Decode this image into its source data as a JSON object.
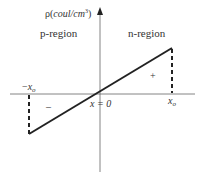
{
  "diagram": {
    "y_axis_label": "ρ(coul/cm³)",
    "y_axis_label_parts": {
      "rho": "ρ(",
      "unit": "coul/cm",
      "exp": "3",
      "close": ")"
    },
    "left_region": "p-region",
    "right_region": "n-region",
    "origin_label": "x = 0",
    "neg_edge_label": {
      "sign": "−",
      "var": "x",
      "sub": "o"
    },
    "pos_edge_label": {
      "var": "x",
      "sub": "o"
    },
    "positive_charge_sign": "+",
    "negative_charge_sign": "–",
    "colors": {
      "axis": "#555555",
      "line": "#222222",
      "text": "#333333"
    }
  }
}
